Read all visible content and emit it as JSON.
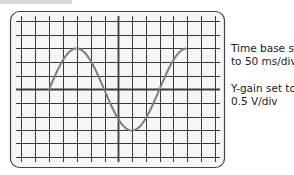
{
  "diagram": {
    "type": "oscilloscope-screen",
    "grid": {
      "vertical_lines": [
        21,
        35,
        49,
        63,
        77,
        91,
        105,
        118,
        132,
        146,
        160,
        173,
        187,
        201,
        215
      ],
      "horizontal_lines": [
        21,
        35,
        48,
        62,
        76,
        89,
        103,
        117,
        130,
        143,
        157
      ],
      "center_x": 118,
      "center_y": 89,
      "divisions_x": 14,
      "divisions_y": 10
    },
    "trace": {
      "description": "Sine wave, 1.5 cycles, starting at zero crossing, amplitude 3 divisions",
      "start_x": 49,
      "end_x": 186,
      "amplitude_divisions": 3,
      "period_divisions": 8,
      "color": "#7d7d7d"
    },
    "colors": {
      "grid": "#3a3a3a",
      "frame": "#444444",
      "background": "#f4f4f4",
      "text": "#222222"
    }
  },
  "labels": {
    "time_base": [
      "Time base set",
      "to 50 ms/div"
    ],
    "y_gain": [
      "Y-gain set to",
      "0.5 V/div"
    ]
  }
}
